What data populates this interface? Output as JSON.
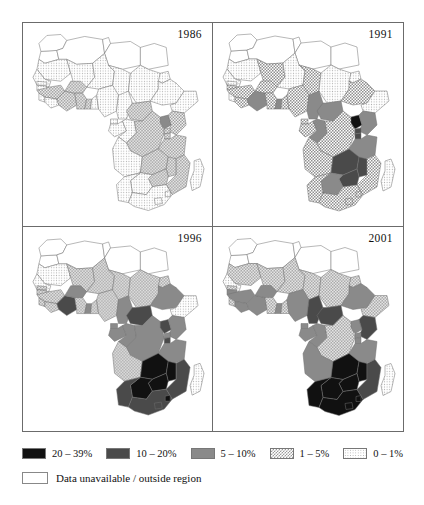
{
  "figure": {
    "type": "choropleth-map-series",
    "panels": [
      {
        "id": "panel-1986",
        "year": "1986"
      },
      {
        "id": "panel-1991",
        "year": "1991"
      },
      {
        "id": "panel-1996",
        "year": "1996"
      },
      {
        "id": "panel-2001",
        "year": "2001"
      }
    ]
  },
  "legend": {
    "classes": [
      {
        "key": "c20",
        "label": "20 – 39%",
        "swatch": "solid-black",
        "color": "#111111"
      },
      {
        "key": "c10",
        "label": "10 – 20%",
        "swatch": "solid-dark-gray",
        "color": "#4a4a4a"
      },
      {
        "key": "c5",
        "label": "5 – 10%",
        "swatch": "solid-mid-gray",
        "color": "#8a8a8a"
      },
      {
        "key": "c1",
        "label": "1 – 5%",
        "swatch": "checkerboard",
        "color": "#9a9a9a"
      },
      {
        "key": "c0",
        "label": "0 – 1%",
        "swatch": "light-stipple",
        "color": "#b4b4b4"
      }
    ],
    "unavailable": {
      "key": "na",
      "label": "Data unavailable / outside region",
      "swatch": "empty-white",
      "color": "#ffffff"
    }
  },
  "chart_data": {
    "type": "heatmap",
    "title": "",
    "subtitle": "",
    "xlabel": "",
    "ylabel": "",
    "legend_position": "bottom",
    "grid": false,
    "value_unit": "percent",
    "categories": [
      "20 – 39%",
      "10 – 20%",
      "5 – 10%",
      "1 – 5%",
      "0 – 1%",
      "Data unavailable / outside region"
    ],
    "series": [
      {
        "name": "1986",
        "regions": {
          "morocco": "na",
          "algeria": "na",
          "tunisia": "na",
          "libya": "na",
          "egypt": "na",
          "western-sahara": "na",
          "mauritania": "c0",
          "mali": "c0",
          "niger": "c0",
          "chad": "c0",
          "sudan": "c0",
          "ethiopia": "c0",
          "eritrea": "c0",
          "somalia": "c0",
          "djibouti": "c0",
          "senegal": "c0",
          "gambia": "c0",
          "guinea-bissau": "c0",
          "guinea": "c1",
          "sierra-leone": "c0",
          "liberia": "c0",
          "ivory-coast": "c1",
          "burkina-faso": "c1",
          "ghana": "c1",
          "togo": "c1",
          "benin": "c0",
          "nigeria": "c0",
          "cameroon": "c0",
          "car": "c1",
          "gabon": "c0",
          "congo": "c0",
          "drc": "c1",
          "uganda": "c5",
          "kenya": "c1",
          "rwanda": "c1",
          "burundi": "c1",
          "tanzania": "c1",
          "zambia": "c1",
          "malawi": "c1",
          "mozambique": "c1",
          "zimbabwe": "c1",
          "angola": "c0",
          "namibia": "c0",
          "botswana": "c0",
          "south-africa": "c0",
          "lesotho": "c0",
          "swaziland": "c0",
          "madagascar": "c0",
          "equatorial-guinea": "c0"
        }
      },
      {
        "name": "1991",
        "regions": {
          "morocco": "na",
          "algeria": "na",
          "tunisia": "na",
          "libya": "na",
          "egypt": "na",
          "western-sahara": "na",
          "mauritania": "c0",
          "mali": "c1",
          "niger": "c0",
          "chad": "c1",
          "sudan": "c0",
          "ethiopia": "c1",
          "eritrea": "c0",
          "somalia": "c0",
          "djibouti": "c1",
          "senegal": "c0",
          "gambia": "c0",
          "guinea-bissau": "c1",
          "guinea": "c1",
          "sierra-leone": "c0",
          "liberia": "c1",
          "ivory-coast": "c5",
          "burkina-faso": "c1",
          "ghana": "c1",
          "togo": "c5",
          "benin": "c1",
          "nigeria": "c1",
          "cameroon": "c5",
          "car": "c5",
          "gabon": "c1",
          "congo": "c5",
          "drc": "c1",
          "uganda": "c20",
          "kenya": "c5",
          "rwanda": "c10",
          "burundi": "c10",
          "tanzania": "c5",
          "zambia": "c10",
          "malawi": "c10",
          "mozambique": "c1",
          "zimbabwe": "c10",
          "angola": "c1",
          "namibia": "c1",
          "botswana": "c5",
          "south-africa": "c1",
          "lesotho": "c1",
          "swaziland": "c1",
          "madagascar": "c0",
          "equatorial-guinea": "c1"
        }
      },
      {
        "name": "1996",
        "regions": {
          "morocco": "na",
          "algeria": "na",
          "tunisia": "na",
          "libya": "na",
          "egypt": "na",
          "western-sahara": "na",
          "mauritania": "c0",
          "mali": "c1",
          "niger": "c1",
          "chad": "c1",
          "sudan": "c1",
          "ethiopia": "c5",
          "eritrea": "c1",
          "somalia": "c0",
          "djibouti": "c5",
          "senegal": "c0",
          "gambia": "c1",
          "guinea-bissau": "c1",
          "guinea": "c1",
          "sierra-leone": "c1",
          "liberia": "c1",
          "ivory-coast": "c10",
          "burkina-faso": "c5",
          "ghana": "c1",
          "togo": "c5",
          "benin": "c1",
          "nigeria": "c1",
          "cameroon": "c5",
          "car": "c10",
          "gabon": "c5",
          "congo": "c5",
          "drc": "c5",
          "uganda": "c10",
          "kenya": "c5",
          "rwanda": "c5",
          "burundi": "c10",
          "tanzania": "c5",
          "zambia": "c20",
          "malawi": "c20",
          "mozambique": "c10",
          "zimbabwe": "c20",
          "angola": "c1",
          "namibia": "c10",
          "botswana": "c20",
          "south-africa": "c10",
          "lesotho": "c10",
          "swaziland": "c20",
          "madagascar": "c0",
          "equatorial-guinea": "c5"
        }
      },
      {
        "name": "2001",
        "regions": {
          "morocco": "na",
          "algeria": "na",
          "tunisia": "na",
          "libya": "na",
          "egypt": "na",
          "western-sahara": "na",
          "mauritania": "c1",
          "mali": "c1",
          "niger": "c1",
          "chad": "c1",
          "sudan": "c1",
          "ethiopia": "c5",
          "eritrea": "c1",
          "somalia": "c1",
          "djibouti": "c5",
          "senegal": "c0",
          "gambia": "c1",
          "guinea-bissau": "c5",
          "guinea": "c5",
          "sierra-leone": "c1",
          "liberia": "c5",
          "ivory-coast": "c5",
          "burkina-faso": "c5",
          "ghana": "c1",
          "togo": "c5",
          "benin": "c1",
          "nigeria": "c5",
          "cameroon": "c10",
          "car": "c10",
          "gabon": "c5",
          "congo": "c5",
          "drc": "c1",
          "uganda": "c5",
          "kenya": "c10",
          "rwanda": "c5",
          "burundi": "c5",
          "tanzania": "c5",
          "zambia": "c20",
          "malawi": "c20",
          "mozambique": "c10",
          "zimbabwe": "c20",
          "angola": "c5",
          "namibia": "c20",
          "botswana": "c20",
          "south-africa": "c20",
          "lesotho": "c20",
          "swaziland": "c20",
          "madagascar": "c0",
          "equatorial-guinea": "c5"
        }
      }
    ]
  }
}
